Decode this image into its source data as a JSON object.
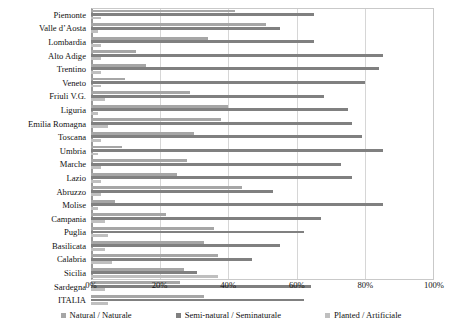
{
  "chart_data": {
    "type": "bar",
    "orientation": "horizontal",
    "title": "",
    "xlabel": "",
    "ylabel": "",
    "xlim": [
      0,
      100
    ],
    "xticks": [
      "0%",
      "20%",
      "40%",
      "60%",
      "80%",
      "100%"
    ],
    "xtick_values": [
      0,
      20,
      40,
      60,
      80,
      100
    ],
    "grid": true,
    "legend_position": "bottom",
    "unit": "%",
    "categories": [
      "Piemonte",
      "Valle d’Aosta",
      "Lombardia",
      "Alto Adige",
      "Trentino",
      "Veneto",
      "Friuli V.G.",
      "Liguria",
      "Emilia Romagna",
      "Toscana",
      "Umbria",
      "Marche",
      "Lazio",
      "Abruzzo",
      "Molise",
      "Campania",
      "Puglia",
      "Basilicata",
      "Calabria",
      "Sicilia",
      "Sardegna",
      "ITALIA"
    ],
    "series": [
      {
        "name": "Natural / Naturale",
        "color": "#a6a6a6",
        "values": [
          42,
          51,
          34,
          13,
          16,
          10,
          29,
          40,
          38,
          30,
          9,
          28,
          25,
          44,
          7,
          22,
          36,
          33,
          37,
          27,
          26,
          33
        ]
      },
      {
        "name": "Semi-natural / Seminaturale",
        "color": "#808080",
        "values": [
          65,
          55,
          65,
          85,
          84,
          80,
          68,
          75,
          76,
          79,
          85,
          73,
          76,
          53,
          85,
          67,
          62,
          55,
          47,
          31,
          64,
          62
        ]
      },
      {
        "name": "Planted / Artificiale",
        "color": "#bfbfbf",
        "values": [
          3,
          2,
          3,
          3,
          3,
          3,
          4,
          2,
          5,
          3,
          2,
          3,
          3,
          3,
          2,
          4,
          5,
          4,
          6,
          37,
          4,
          5
        ]
      }
    ]
  },
  "legend": {
    "items": [
      {
        "label": "Natural / Naturale",
        "color": "#a6a6a6"
      },
      {
        "label": "Semi-natural / Seminaturale",
        "color": "#808080"
      },
      {
        "label": "Planted / Artificiale",
        "color": "#bfbfbf"
      }
    ]
  }
}
